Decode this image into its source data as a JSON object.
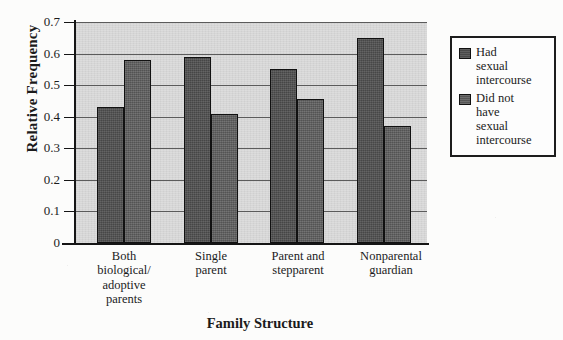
{
  "chart_data": {
    "type": "bar",
    "title": "",
    "xlabel": "Family Structure",
    "ylabel": "Relative Frequency",
    "ylim": [
      0,
      0.7
    ],
    "ytick_labels": [
      "0.7",
      "0.6",
      "0.5",
      "0.4",
      "0.3",
      "0.2",
      "0.1",
      "0"
    ],
    "ytick_values": [
      0.7,
      0.6,
      0.5,
      0.4,
      0.3,
      0.2,
      0.1,
      0
    ],
    "grid": true,
    "grid_axis": "y",
    "legend_position": "right",
    "categories": [
      "Both biological/ adoptive parents",
      "Single parent",
      "Parent and stepparent",
      "Nonparental guardian"
    ],
    "category_lines": [
      [
        "Both",
        "biological/",
        "adoptive",
        "parents"
      ],
      [
        "Single",
        "parent"
      ],
      [
        "Parent and",
        "stepparent"
      ],
      [
        "Nonparental",
        "guardian"
      ]
    ],
    "series": [
      {
        "name": "Had sexual intercourse",
        "name_lines": [
          "Had",
          "sexual",
          "intercourse"
        ],
        "color": "#4f4f4f",
        "values": [
          0.43,
          0.59,
          0.55,
          0.65
        ]
      },
      {
        "name": "Did not have sexual intercourse",
        "name_lines": [
          "Did not",
          "have",
          "sexual",
          "intercourse"
        ],
        "color": "#5c5c5c",
        "values": [
          0.58,
          0.41,
          0.455,
          0.37
        ]
      }
    ],
    "plot_background": "#d6d6d6",
    "axis_color": "#151515"
  },
  "legend": {
    "entries": [
      {
        "swatch": "legend-swatch-had-intercourse",
        "label": "Had sexual intercourse"
      },
      {
        "swatch": "legend-swatch-no-intercourse",
        "label": "Did not have sexual intercourse"
      }
    ]
  }
}
